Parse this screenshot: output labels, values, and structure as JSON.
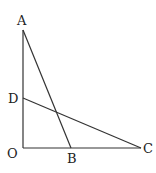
{
  "diagram": {
    "points": {
      "A": {
        "label": "A",
        "x": 23,
        "y": 30
      },
      "D": {
        "label": "D",
        "x": 23,
        "y": 98
      },
      "O": {
        "label": "O",
        "x": 23,
        "y": 148
      },
      "B": {
        "label": "B",
        "x": 71,
        "y": 148
      },
      "C": {
        "label": "C",
        "x": 141,
        "y": 148
      }
    },
    "segments": [
      [
        "A",
        "O"
      ],
      [
        "O",
        "C"
      ],
      [
        "A",
        "B"
      ],
      [
        "D",
        "C"
      ]
    ],
    "colors": {
      "line": "#333333",
      "text": "#222222",
      "background": "#ffffff"
    }
  }
}
